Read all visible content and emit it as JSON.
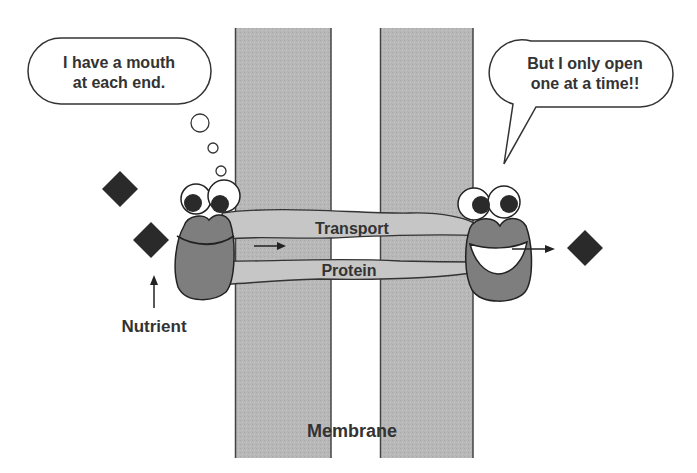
{
  "diagram": {
    "left_bubble": {
      "line1": "I have a mouth",
      "line2": "at each end.",
      "type": "thought"
    },
    "right_bubble": {
      "line1": "But I only open",
      "line2": "one at a time!!",
      "type": "speech"
    },
    "protein_labels": {
      "top": "Transport",
      "bottom": "Protein"
    },
    "nutrient_label": "Nutrient",
    "membrane_label": "Membrane",
    "colors": {
      "membrane": "#b4b4b4",
      "membrane_edge": "#444444",
      "protein_tube": "#c4c4c4",
      "mouth_body": "#7a7a7a",
      "nutrient": "#2a2a2a",
      "text": "#333333"
    },
    "icons": [
      "nutrient-diamond-icon",
      "arrow-icon",
      "eye-icon"
    ]
  }
}
